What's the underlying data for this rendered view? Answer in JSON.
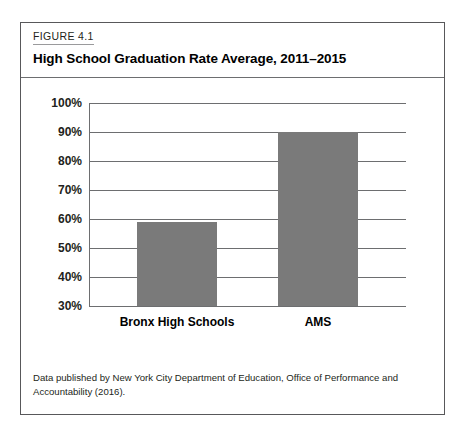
{
  "figure": {
    "kicker": "FIGURE 4.1",
    "title": "High School Graduation Rate Average, 2011–2015",
    "source_note": "Data published by New York City Department of Education, Office of Performance and Accountability (2016)."
  },
  "colors": {
    "bar_fill": "#7a7a7a",
    "gridline": "#6d6e70",
    "frame": "#58585a",
    "text": "#231f20"
  },
  "chart_data": {
    "type": "bar",
    "title": "High School Graduation Rate Average, 2011–2015",
    "xlabel": "",
    "ylabel": "",
    "categories": [
      "Bronx High Schools",
      "AMS"
    ],
    "values": [
      59,
      90
    ],
    "value_unit": "%",
    "ylim": [
      30,
      100
    ],
    "yticks": [
      100,
      90,
      80,
      70,
      60,
      50,
      40,
      30
    ],
    "ytick_labels": [
      "100%",
      "90%",
      "80%",
      "70%",
      "60%",
      "50%",
      "40%",
      "30%"
    ],
    "grid": true,
    "legend": false
  }
}
